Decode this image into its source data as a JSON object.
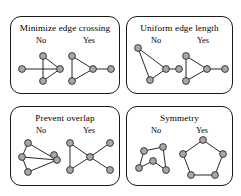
{
  "figure": {
    "background_color": "#ffffff",
    "node_fill_color": "#a8a8a8",
    "node_stroke_color": "#2b2b2b",
    "edge_color": "#111111",
    "panel_border_color": "#1a1a1a"
  },
  "panels": [
    {
      "id": "minimize-edge-crossing",
      "title": "Minimize edge crossing",
      "no_label": "No",
      "yes_label": "Yes",
      "no_graph": {
        "nodes": [
          {
            "id": "a",
            "x": 4,
            "y": 19
          },
          {
            "id": "b",
            "x": 25,
            "y": 6
          },
          {
            "id": "c",
            "x": 42,
            "y": 19
          },
          {
            "id": "d",
            "x": 25,
            "y": 31
          }
        ],
        "edges": [
          {
            "from": "a",
            "to": "c"
          },
          {
            "from": "b",
            "to": "c"
          },
          {
            "from": "b",
            "to": "d"
          },
          {
            "from": "d",
            "to": "c"
          }
        ],
        "crossings": 1
      },
      "yes_graph": {
        "nodes": [
          {
            "id": "a",
            "x": 5,
            "y": 6
          },
          {
            "id": "b",
            "x": 5,
            "y": 31
          },
          {
            "id": "c",
            "x": 26,
            "y": 19
          },
          {
            "id": "d",
            "x": 44,
            "y": 19
          }
        ],
        "edges": [
          {
            "from": "a",
            "to": "b"
          },
          {
            "from": "a",
            "to": "c"
          },
          {
            "from": "b",
            "to": "c"
          },
          {
            "from": "c",
            "to": "d"
          }
        ],
        "crossings": 0
      }
    },
    {
      "id": "uniform-edge-length",
      "title": "Uniform edge length",
      "no_label": "No",
      "yes_label": "Yes",
      "no_graph": {
        "nodes": [
          {
            "id": "a",
            "x": 5,
            "y": 3
          },
          {
            "id": "b",
            "x": 17,
            "y": 35
          },
          {
            "id": "c",
            "x": 33,
            "y": 24
          },
          {
            "id": "d",
            "x": 46,
            "y": 24
          }
        ],
        "edges": [
          {
            "from": "a",
            "to": "b"
          },
          {
            "from": "a",
            "to": "c"
          },
          {
            "from": "b",
            "to": "c"
          },
          {
            "from": "c",
            "to": "d"
          }
        ],
        "crossings": 0
      },
      "yes_graph": {
        "nodes": [
          {
            "id": "a",
            "x": 5,
            "y": 6
          },
          {
            "id": "b",
            "x": 5,
            "y": 31
          },
          {
            "id": "c",
            "x": 26,
            "y": 19
          },
          {
            "id": "d",
            "x": 44,
            "y": 19
          }
        ],
        "edges": [
          {
            "from": "a",
            "to": "b"
          },
          {
            "from": "a",
            "to": "c"
          },
          {
            "from": "b",
            "to": "c"
          },
          {
            "from": "c",
            "to": "d"
          }
        ],
        "crossings": 0
      }
    },
    {
      "id": "prevent-overlap",
      "title": "Prevent overlap",
      "no_label": "No",
      "yes_label": "Yes",
      "no_graph": {
        "nodes": [
          {
            "id": "a",
            "x": 9,
            "y": 4
          },
          {
            "id": "b",
            "x": 3,
            "y": 18
          },
          {
            "id": "c",
            "x": 9,
            "y": 33
          },
          {
            "id": "d",
            "x": 35,
            "y": 16
          },
          {
            "id": "e",
            "x": 38,
            "y": 21
          }
        ],
        "edges": [
          {
            "from": "a",
            "to": "b"
          },
          {
            "from": "b",
            "to": "c"
          },
          {
            "from": "a",
            "to": "e"
          },
          {
            "from": "b",
            "to": "e"
          },
          {
            "from": "c",
            "to": "e"
          }
        ],
        "overlapping_nodes": true
      },
      "yes_graph": {
        "nodes": [
          {
            "id": "a",
            "x": 4,
            "y": 5
          },
          {
            "id": "b",
            "x": 4,
            "y": 32
          },
          {
            "id": "c",
            "x": 24,
            "y": 19
          },
          {
            "id": "d",
            "x": 44,
            "y": 5
          },
          {
            "id": "e",
            "x": 44,
            "y": 32
          }
        ],
        "edges": [
          {
            "from": "a",
            "to": "b"
          },
          {
            "from": "a",
            "to": "c"
          },
          {
            "from": "b",
            "to": "c"
          },
          {
            "from": "c",
            "to": "d"
          },
          {
            "from": "c",
            "to": "e"
          }
        ],
        "overlapping_nodes": false
      }
    },
    {
      "id": "symmetry",
      "title": "Symmetry",
      "no_label": "No",
      "yes_label": "Yes",
      "no_graph": {
        "nodes": [
          {
            "id": "a",
            "x": 8,
            "y": 7
          },
          {
            "id": "b",
            "x": 27,
            "y": 3
          },
          {
            "id": "c",
            "x": 17,
            "y": 17
          },
          {
            "id": "d",
            "x": 3,
            "y": 24
          },
          {
            "id": "e",
            "x": 30,
            "y": 26
          }
        ],
        "edges": [
          {
            "from": "a",
            "to": "b"
          },
          {
            "from": "b",
            "to": "e"
          },
          {
            "from": "e",
            "to": "c"
          },
          {
            "from": "c",
            "to": "d"
          },
          {
            "from": "d",
            "to": "a"
          }
        ],
        "symmetric": false
      },
      "yes_graph": {
        "nodes": [
          {
            "id": "a",
            "x": 22,
            "y": 2
          },
          {
            "id": "b",
            "x": 42,
            "y": 16
          },
          {
            "id": "c",
            "x": 34,
            "y": 37
          },
          {
            "id": "d",
            "x": 10,
            "y": 37
          },
          {
            "id": "e",
            "x": 2,
            "y": 16
          }
        ],
        "edges": [
          {
            "from": "a",
            "to": "b"
          },
          {
            "from": "b",
            "to": "c"
          },
          {
            "from": "c",
            "to": "d"
          },
          {
            "from": "d",
            "to": "e"
          },
          {
            "from": "e",
            "to": "a"
          }
        ],
        "symmetric": true
      }
    }
  ]
}
